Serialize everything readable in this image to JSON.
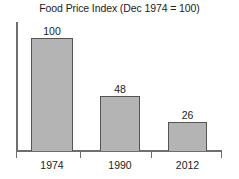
{
  "chart_data": {
    "type": "bar",
    "title": "Food Price Index (Dec 1974 = 100)",
    "categories": [
      "1974",
      "1990",
      "2012"
    ],
    "values": [
      100,
      48,
      26
    ],
    "value_labels": [
      "100",
      "48",
      "26"
    ],
    "xlabel": "",
    "ylabel": "",
    "ylim": [
      0,
      115
    ],
    "grid": false,
    "legend": false,
    "legend_position": "none",
    "bar_fill_color": "#b4b4b4",
    "bar_border_color": "#555555",
    "axis_color": "#6e6e6e",
    "text_color": "#1c1c1c",
    "background_color": "#ffffff",
    "y_tick_labels": [],
    "series": [
      {
        "name": "Food Price Index",
        "values": [
          100,
          48,
          26
        ]
      }
    ]
  }
}
